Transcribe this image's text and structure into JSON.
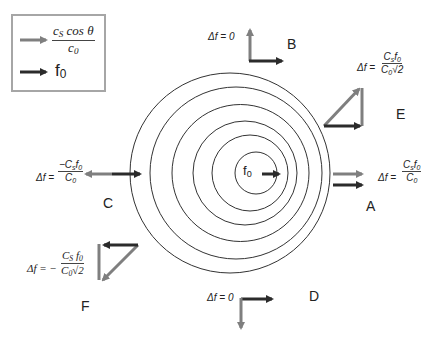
{
  "legend": {
    "items": [
      {
        "arrow": "gray-arrow",
        "color": "#7f7f7f",
        "label_num": "c",
        "label_num_sub": "S",
        "label_num_rest": " cos θ",
        "label_den": "c",
        "label_den_sub": "0"
      },
      {
        "arrow": "dark-arrow",
        "color": "#2b2b2b",
        "label": "f",
        "label_sub": "0"
      }
    ]
  },
  "source": {
    "label": "f",
    "label_sub": "0"
  },
  "colors": {
    "gray_arrow": "#7f7f7f",
    "dark_arrow": "#2b2b2b",
    "circle": "#333333",
    "legend_border": "#a6a6a6"
  },
  "observers": {
    "A": {
      "label": "A",
      "eq_prefix": "Δf =",
      "num": "C",
      "num_sub": "s",
      "num_rest": "f",
      "num_rest_sub": "0",
      "den": "C",
      "den_sub": "0"
    },
    "B": {
      "label": "B",
      "eq": "Δf = 0"
    },
    "C": {
      "label": "C",
      "eq_prefix": "Δf =",
      "num": "−C",
      "num_sub": "s",
      "num_rest": "f",
      "num_rest_sub": "0",
      "den": "C",
      "den_sub": "0"
    },
    "D": {
      "label": "D",
      "eq": "Δf = 0"
    },
    "E": {
      "label": "E",
      "eq_prefix": "Δf =",
      "num": "C",
      "num_sub": "s",
      "num_rest": "f",
      "num_rest_sub": "0",
      "den": "C",
      "den_sub": "0",
      "den_rest": "√2"
    },
    "F": {
      "label": "F",
      "eq_prefix": "Δf = −",
      "num": "C",
      "num_sub": "S",
      "num_rest": " f",
      "num_rest_sub": "0",
      "den": "C",
      "den_sub": "0",
      "den_rest": "√2"
    }
  },
  "circles": [
    {
      "cx": 230,
      "cy": 173,
      "r": 100
    },
    {
      "cx": 236,
      "cy": 173,
      "r": 86
    },
    {
      "cx": 240.5,
      "cy": 173,
      "r": 68.5
    },
    {
      "cx": 245,
      "cy": 173,
      "r": 52
    },
    {
      "cx": 250,
      "cy": 173,
      "r": 38
    },
    {
      "cx": 256,
      "cy": 173,
      "r": 21
    }
  ]
}
